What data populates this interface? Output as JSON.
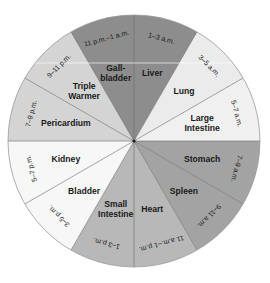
{
  "diagram": {
    "type": "circular-24h-clock",
    "center": [
      134,
      141
    ],
    "radius": 126,
    "segments": [
      {
        "organ": [
          "Liver"
        ],
        "time": "1–3 a.m.",
        "color": "#8d8d8d"
      },
      {
        "organ": [
          "Lung"
        ],
        "time": "3–5 a.m.",
        "color": "#ebebeb"
      },
      {
        "organ": [
          "Large",
          "Intestine"
        ],
        "time": "5–7 a.m.",
        "color": "#f0f0f0"
      },
      {
        "organ": [
          "Stomach"
        ],
        "time": "7–9 a.m.",
        "color": "#a3a3a3"
      },
      {
        "organ": [
          "Spleen"
        ],
        "time": "9–11 a.m.",
        "color": "#a3a3a3"
      },
      {
        "organ": [
          "Heart"
        ],
        "time": "11 a.m.–1 p.m.",
        "color": "#b8b8b8"
      },
      {
        "organ": [
          "Small",
          "Intestine"
        ],
        "time": "1–3 p.m.",
        "color": "#b8b8b8"
      },
      {
        "organ": [
          "Bladder"
        ],
        "time": "3–5 p.m.",
        "color": "#f7f7f7"
      },
      {
        "organ": [
          "Kidney"
        ],
        "time": "5–7 p.m.",
        "color": "#f7f7f7"
      },
      {
        "organ": [
          "Pericardium"
        ],
        "time": "7–9 p.m.",
        "color": "#d4d4d4"
      },
      {
        "organ": [
          "Triple",
          "Warmer"
        ],
        "time": "9–11 p.m.",
        "color": "#d4d4d4"
      },
      {
        "organ": [
          "Gall-",
          "bladder"
        ],
        "time": "11 p.m.–1 a.m.",
        "color": "#8d8d8d"
      }
    ]
  }
}
